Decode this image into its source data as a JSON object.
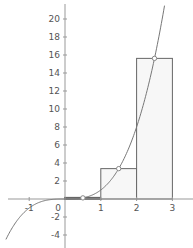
{
  "chart_data": {
    "type": "line",
    "title": "",
    "function": "f(x) = x^3",
    "xlabel": "",
    "ylabel": "",
    "xlim": [
      -1.8,
      3.5
    ],
    "ylim": [
      -5.5,
      22
    ],
    "grid": false,
    "x_ticks": [
      -1,
      0,
      1,
      2,
      3
    ],
    "x_tick_labels": [
      "-1",
      "0",
      "1",
      "2",
      "3"
    ],
    "y_ticks": [
      -4,
      -2,
      2,
      4,
      6,
      8,
      10,
      12,
      14,
      16,
      18,
      20
    ],
    "y_tick_labels": [
      "-4",
      "-2",
      "2",
      "4",
      "6",
      "8",
      "10",
      "12",
      "14",
      "16",
      "18",
      "20"
    ],
    "series": [
      {
        "name": "x^3 curve",
        "type": "line",
        "x": [
          -1.65,
          -1.5,
          -1.25,
          -1,
          -0.75,
          -0.5,
          -0.25,
          0,
          0.25,
          0.5,
          0.75,
          1,
          1.25,
          1.5,
          1.75,
          2,
          2.25,
          2.5,
          2.75,
          2.78
        ],
        "y": [
          -4.49,
          -3.375,
          -1.953,
          -1,
          -0.422,
          -0.125,
          -0.016,
          0,
          0.016,
          0.125,
          0.422,
          1,
          1.953,
          3.375,
          5.359,
          8,
          11.39,
          15.625,
          20.8,
          21.48
        ]
      },
      {
        "name": "midpoint rectangles",
        "type": "bar",
        "intervals": [
          [
            0,
            1
          ],
          [
            1,
            2
          ],
          [
            2,
            3
          ]
        ],
        "values": [
          0.125,
          3.375,
          15.625
        ]
      },
      {
        "name": "midpoint samples",
        "type": "scatter",
        "x": [
          0.5,
          1.5,
          2.5
        ],
        "y": [
          0.125,
          3.375,
          15.625
        ]
      }
    ],
    "colors": {
      "curve": "#777777",
      "rect_stroke": "#666666",
      "rect_fill": "#f7f7f7",
      "axis": "#999999",
      "point_fill": "#ffffff",
      "point_stroke": "#888888"
    }
  }
}
